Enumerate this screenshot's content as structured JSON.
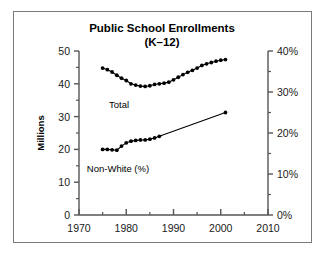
{
  "chart_data": {
    "type": "line",
    "title": "Public School Enrollments",
    "subtitle": "(K–12)",
    "xlabel": "",
    "ylabel": "Millions",
    "y2label": "",
    "xlim": [
      1970,
      2010
    ],
    "ylim": [
      0,
      50
    ],
    "y2lim": [
      0,
      40
    ],
    "grid": false,
    "legend_position": "inline-annotation",
    "xticks": [
      1970,
      1980,
      1990,
      2000,
      2010
    ],
    "xtick_labels": [
      "1970",
      "1980",
      "1990",
      "2000",
      "2010"
    ],
    "xminor_ticks": [
      1975,
      1985,
      1995,
      2005
    ],
    "yticks": [
      0,
      10,
      20,
      30,
      40,
      50
    ],
    "ytick_labels": [
      "0",
      "10",
      "20",
      "30",
      "40",
      "50"
    ],
    "yminor_ticks": [
      5,
      15,
      25,
      35,
      45
    ],
    "y2ticks": [
      0,
      10,
      20,
      30,
      40
    ],
    "y2tick_labels": [
      "0%",
      "10%",
      "20%",
      "30%",
      "40%"
    ],
    "y2minor_ticks": [
      5,
      15,
      25,
      35
    ],
    "series": [
      {
        "name": "Total",
        "axis": "left",
        "units": "millions",
        "annotation": "Total",
        "marker": "filled-circle",
        "x": [
          1975,
          1976,
          1977,
          1978,
          1979,
          1980,
          1981,
          1982,
          1983,
          1984,
          1985,
          1986,
          1987,
          1988,
          1989,
          1990,
          1991,
          1992,
          1993,
          1994,
          1995,
          1996,
          1997,
          1998,
          1999,
          2000,
          2001
        ],
        "values": [
          44.8,
          44.3,
          43.6,
          42.6,
          41.7,
          41.0,
          40.0,
          39.6,
          39.3,
          39.2,
          39.4,
          39.8,
          40.0,
          40.2,
          40.5,
          41.2,
          42.0,
          42.8,
          43.5,
          44.1,
          44.8,
          45.6,
          46.1,
          46.5,
          46.9,
          47.2,
          47.4
        ],
        "start_value": 44.8,
        "min_value": 39.2,
        "min_year": 1984,
        "end_value": 47.4
      },
      {
        "name": "Non-White (%)",
        "axis": "right",
        "units": "percent",
        "annotation": "Non-White (%)",
        "marker": "filled-circle",
        "x": [
          1975,
          1976,
          1977,
          1978,
          1979,
          1980,
          1981,
          1982,
          1983,
          1984,
          1985,
          1986,
          1987,
          2001
        ],
        "values": [
          16.0,
          16.0,
          15.9,
          15.8,
          16.8,
          17.6,
          18.0,
          18.2,
          18.3,
          18.3,
          18.5,
          18.8,
          19.2,
          25.0
        ],
        "start_value": 16.0,
        "end_value": 25.0
      }
    ]
  },
  "style": {
    "frame_color": "#7a7a7a",
    "axis_color": "#555555",
    "data_color": "#000000",
    "background": "#ffffff"
  }
}
